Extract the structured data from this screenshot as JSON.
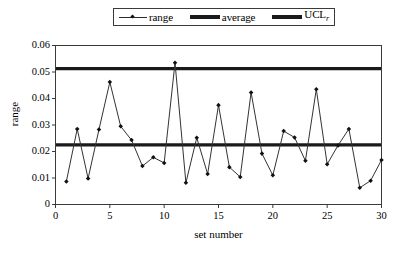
{
  "chart_data": {
    "type": "line",
    "title": "",
    "xlabel": "set number",
    "ylabel": "range",
    "xlim": [
      0,
      30
    ],
    "ylim": [
      0,
      0.06
    ],
    "xticks": [
      0,
      5,
      10,
      15,
      20,
      25,
      30
    ],
    "yticks": [
      0,
      0.01,
      0.02,
      0.03,
      0.04,
      0.05,
      0.06
    ],
    "ytick_labels": [
      "0",
      "0.01",
      "0.02",
      "0.03",
      "0.04",
      "0.05",
      "0.06"
    ],
    "xtick_labels": [
      "0",
      "5",
      "10",
      "15",
      "20",
      "25",
      "30"
    ],
    "grid": false,
    "legend_position": "above-plot",
    "legend": [
      {
        "name": "range",
        "style": "thin-line-with-markers"
      },
      {
        "name": "average",
        "style": "thick-line"
      },
      {
        "name": "UCL",
        "subscript": "r",
        "style": "thick-line"
      }
    ],
    "x": [
      1,
      2,
      3,
      4,
      5,
      6,
      7,
      8,
      9,
      10,
      11,
      12,
      13,
      14,
      15,
      16,
      17,
      18,
      19,
      20,
      21,
      22,
      23,
      24,
      25,
      26,
      27,
      28,
      29,
      30
    ],
    "series": [
      {
        "name": "range",
        "values": [
          0.0087,
          0.0285,
          0.0098,
          0.0283,
          0.0462,
          0.0295,
          0.0243,
          0.0145,
          0.0178,
          0.0157,
          0.0535,
          0.0082,
          0.0252,
          0.0115,
          0.0375,
          0.0141,
          0.0104,
          0.0423,
          0.0192,
          0.011,
          0.0277,
          0.0253,
          0.0165,
          0.0435,
          0.0152,
          0.0223,
          0.0285,
          0.0063,
          0.009,
          0.0168
        ]
      }
    ],
    "reference_lines": [
      {
        "name": "average",
        "value": 0.0225
      },
      {
        "name": "UCL_r",
        "value": 0.0513
      }
    ]
  }
}
